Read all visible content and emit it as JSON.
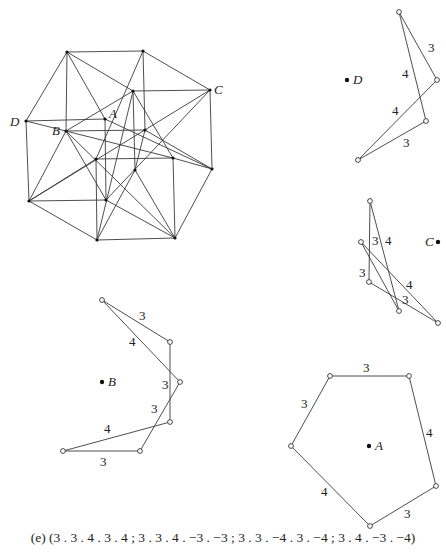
{
  "figure": {
    "caption": "(e) (3 . 3 . 4 . 3 . 4 ; 3 . 3 . 4 . −3 . −3 ; 3 . 3 . −4 . 3 . −4 ; 3 . 4 . −3 . −4)",
    "colors": {
      "line": "#3a3a3a",
      "text": "#222222",
      "background": "#ffffff"
    },
    "polytope": {
      "vertices": [
        [
          67,
          52
        ],
        [
          143,
          51
        ],
        [
          210,
          90
        ],
        [
          133,
          91
        ],
        [
          26,
          121
        ],
        [
          105,
          119
        ],
        [
          66,
          131
        ],
        [
          145,
          130
        ],
        [
          173,
          158
        ],
        [
          96,
          159
        ],
        [
          135,
          170
        ],
        [
          212,
          169
        ],
        [
          29,
          201
        ],
        [
          106,
          200
        ],
        [
          97,
          240
        ],
        [
          175,
          238
        ]
      ],
      "edges": [
        [
          0,
          1
        ],
        [
          0,
          4
        ],
        [
          0,
          6
        ],
        [
          0,
          5
        ],
        [
          0,
          3
        ],
        [
          1,
          2
        ],
        [
          1,
          7
        ],
        [
          1,
          9
        ],
        [
          2,
          3
        ],
        [
          2,
          11
        ],
        [
          2,
          13
        ],
        [
          2,
          12
        ],
        [
          3,
          6
        ],
        [
          3,
          10
        ],
        [
          3,
          8
        ],
        [
          3,
          14
        ],
        [
          4,
          5
        ],
        [
          4,
          12
        ],
        [
          4,
          8
        ],
        [
          5,
          11
        ],
        [
          5,
          13
        ],
        [
          6,
          7
        ],
        [
          6,
          12
        ],
        [
          6,
          13
        ],
        [
          6,
          15
        ],
        [
          7,
          10
        ],
        [
          7,
          11
        ],
        [
          8,
          9
        ],
        [
          8,
          11
        ],
        [
          8,
          15
        ],
        [
          9,
          12
        ],
        [
          9,
          14
        ],
        [
          10,
          14
        ],
        [
          10,
          15
        ],
        [
          11,
          15
        ],
        [
          12,
          13
        ],
        [
          12,
          14
        ],
        [
          13,
          15
        ],
        [
          14,
          15
        ]
      ],
      "labels": [
        {
          "text": "D",
          "x": 10,
          "y": 126,
          "vertex": 4
        },
        {
          "text": "A",
          "x": 109,
          "y": 118,
          "vertex": 5
        },
        {
          "text": "B",
          "x": 52,
          "y": 135,
          "vertex": 6
        },
        {
          "text": "C",
          "x": 214,
          "y": 94,
          "vertex": 2
        }
      ]
    },
    "vertex_figures": [
      {
        "id": "D",
        "center_label": "D",
        "center": [
          347,
          80
        ],
        "vertices": [
          [
            399,
            12
          ],
          [
            437,
            80
          ],
          [
            358,
            160
          ],
          [
            426,
            121
          ]
        ],
        "edges": [
          {
            "from": 0,
            "to": 1,
            "label": "3",
            "lx": 428,
            "ly": 52
          },
          {
            "from": 1,
            "to": 2,
            "label": "4",
            "lx": 392,
            "ly": 115
          },
          {
            "from": 2,
            "to": 3,
            "label": "3",
            "lx": 403,
            "ly": 147
          },
          {
            "from": 3,
            "to": 0,
            "label": "4",
            "lx": 402,
            "ly": 78
          }
        ]
      },
      {
        "id": "C",
        "center_label": "C",
        "center": [
          438,
          242
        ],
        "vertices": [
          [
            370,
            201
          ],
          [
            361,
            242
          ],
          [
            369,
            282
          ],
          [
            399,
            311
          ],
          [
            438,
            323
          ]
        ],
        "edges": [
          {
            "from": 0,
            "to": 2,
            "label": "3",
            "lx": 372,
            "ly": 245
          },
          {
            "from": 0,
            "to": 3,
            "label": "4",
            "lx": 385,
            "ly": 245
          },
          {
            "from": 1,
            "to": 4,
            "label": "4",
            "lx": 406,
            "ly": 289
          },
          {
            "from": 1,
            "to": 3,
            "label": "3",
            "lx": 359,
            "ly": 277
          },
          {
            "from": 2,
            "to": 4,
            "label": "3",
            "lx": 402,
            "ly": 304
          }
        ]
      },
      {
        "id": "B",
        "center_label": "B",
        "center": [
          102,
          382
        ],
        "vertices": [
          [
            102,
            300
          ],
          [
            170,
            342
          ],
          [
            180,
            382
          ],
          [
            170,
            422
          ],
          [
            140,
            451
          ],
          [
            63,
            451
          ]
        ],
        "edges": [
          {
            "from": 0,
            "to": 1,
            "label": "3",
            "lx": 139,
            "ly": 320
          },
          {
            "from": 0,
            "to": 2,
            "label": "4",
            "lx": 129,
            "ly": 346
          },
          {
            "from": 1,
            "to": 3,
            "label": "3",
            "lx": 162,
            "ly": 389
          },
          {
            "from": 2,
            "to": 4,
            "label": "3",
            "lx": 151,
            "ly": 413
          },
          {
            "from": 3,
            "to": 5,
            "label": "4",
            "lx": 104,
            "ly": 433
          },
          {
            "from": 5,
            "to": 4,
            "label": "3",
            "lx": 100,
            "ly": 466
          }
        ]
      },
      {
        "id": "A",
        "center_label": "A",
        "center": [
          369,
          446
        ],
        "vertices": [
          [
            330,
            376
          ],
          [
            409,
            376
          ],
          [
            436,
            486
          ],
          [
            370,
            526
          ],
          [
            291,
            446
          ]
        ],
        "edges": [
          {
            "from": 0,
            "to": 1,
            "label": "3",
            "lx": 363,
            "ly": 372
          },
          {
            "from": 1,
            "to": 2,
            "label": "4",
            "lx": 426,
            "ly": 437
          },
          {
            "from": 2,
            "to": 3,
            "label": "3",
            "lx": 404,
            "ly": 518
          },
          {
            "from": 3,
            "to": 4,
            "label": "4",
            "lx": 321,
            "ly": 496
          },
          {
            "from": 4,
            "to": 0,
            "label": "3",
            "lx": 301,
            "ly": 408
          }
        ]
      }
    ]
  }
}
